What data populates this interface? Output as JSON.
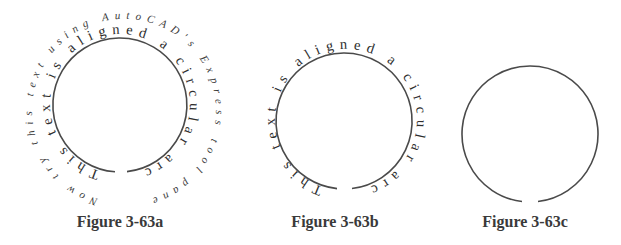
{
  "figures": [
    {
      "id": "a",
      "caption": "Figure 3-63a",
      "inner_text": "This text is aligned a circular arc!",
      "outer_text": "Now try this text using AutoCAD's Express tool panel.",
      "arc": {
        "cx": 120,
        "cy": 105,
        "r": 67,
        "gap": "bottom"
      }
    },
    {
      "id": "b",
      "caption": "Figure 3-63b",
      "inner_text": "This text is aligned a circular arc!",
      "arc": {
        "cx": 344,
        "cy": 121,
        "r": 68,
        "gap": "bottom"
      }
    },
    {
      "id": "c",
      "caption": "Figure 3-63c",
      "arc": {
        "cx": 530,
        "cy": 134,
        "r": 68,
        "gap": "bottom"
      }
    }
  ],
  "colors": {
    "stroke": "#4a4a4a",
    "text": "#2e2e2e",
    "background": "#ffffff"
  }
}
